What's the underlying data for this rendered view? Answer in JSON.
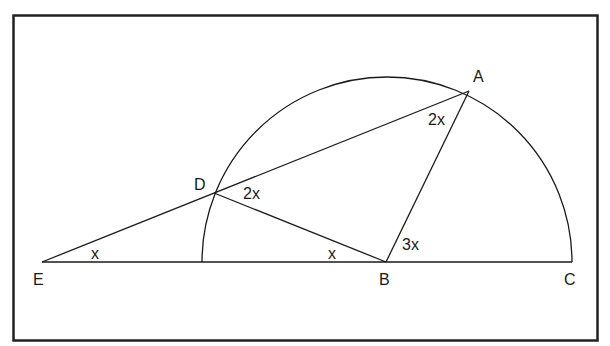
{
  "diagram": {
    "type": "geometry",
    "points": {
      "A": {
        "label": "A",
        "x": 469,
        "y": 91
      },
      "B": {
        "label": "B",
        "x": 386,
        "y": 262
      },
      "C": {
        "label": "C",
        "x": 572,
        "y": 262
      },
      "D": {
        "label": "D",
        "x": 214,
        "y": 193
      },
      "E": {
        "label": "E",
        "x": 42,
        "y": 262
      }
    },
    "angles": {
      "angle_E": "x",
      "angle_DBE": "x",
      "angle_ADB": "2x",
      "angle_DAB": "2x",
      "angle_ABC": "3x"
    },
    "colors": {
      "stroke": "#1a1a1a",
      "frame": "#222222",
      "background": "#ffffff"
    }
  }
}
